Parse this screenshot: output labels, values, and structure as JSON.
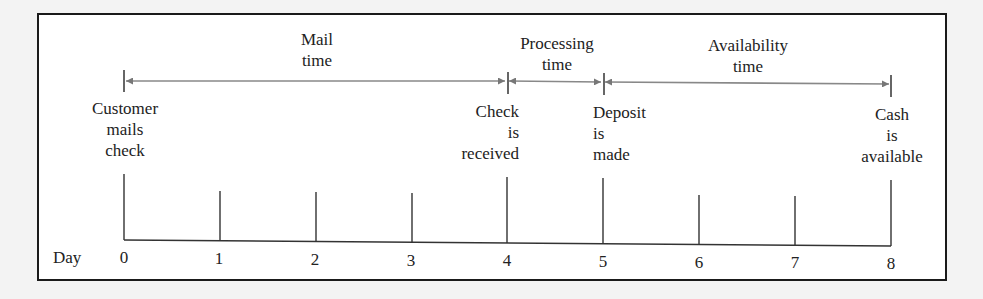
{
  "diagram": {
    "type": "timeline",
    "axis_label": "Day",
    "days": [
      "0",
      "1",
      "2",
      "3",
      "4",
      "5",
      "6",
      "7",
      "8"
    ],
    "intervals": [
      {
        "label_line1": "Mail",
        "label_line2": "time",
        "from_day": 0,
        "to_day": 4
      },
      {
        "label_line1": "Processing",
        "label_line2": "time",
        "from_day": 4,
        "to_day": 5
      },
      {
        "label_line1": "Availability",
        "label_line2": "time",
        "from_day": 5,
        "to_day": 8
      }
    ],
    "events": [
      {
        "day": 0,
        "lines": [
          "Customer",
          "mails",
          "check"
        ]
      },
      {
        "day": 4,
        "lines": [
          "Check",
          "is",
          "received"
        ]
      },
      {
        "day": 5,
        "lines": [
          "Deposit",
          "is",
          "made"
        ]
      },
      {
        "day": 8,
        "lines": [
          "Cash",
          "is",
          "available"
        ]
      }
    ],
    "colors": {
      "arrow": "#777777",
      "line": "#222222",
      "frame": "#1a1a1a",
      "text": "#222222"
    }
  }
}
